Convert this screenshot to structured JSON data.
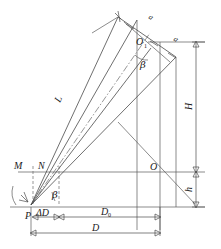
{
  "figure": {
    "kind": "geometric-survey-diagram",
    "background_color": "#ffffff",
    "line_color": "#4a4a4a",
    "text_color": "#1a1a1a",
    "labels": {
      "point_P": "P",
      "point_M": "M",
      "point_N": "N",
      "point_O": "O",
      "point_O1": "O",
      "point_O1_subscript": "1",
      "slant_L": "L",
      "segment_a_upper": "a",
      "segment_a_lower": "a",
      "angle_beta_upper": "β",
      "angle_beta_lower": "β",
      "height_H": "H",
      "height_h": "h",
      "delta_D": "ΔD",
      "distance_D0": "D",
      "distance_D0_subscript": "0",
      "distance_D": "D"
    }
  }
}
